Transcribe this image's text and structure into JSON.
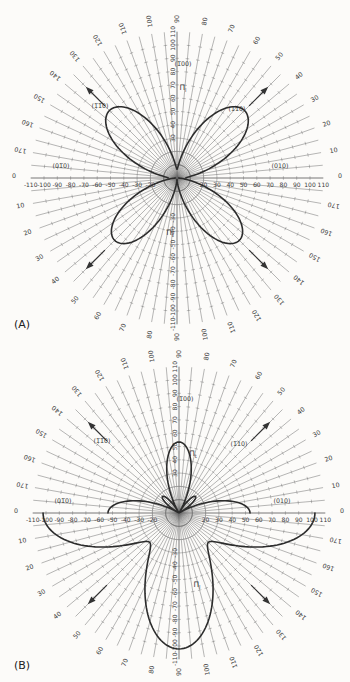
{
  "figure": {
    "background": "#fcfbf9",
    "colors": {
      "grid": "#6f6f6f",
      "axis": "#565656",
      "curve": "#2c2c2c",
      "text": "#3a3a3a",
      "arrow": "#333333"
    },
    "panels": [
      {
        "id": "A",
        "corner_label": "(A)",
        "crystal_labels": {
          "top": "(1̅00)",
          "right": "(010)",
          "left": "(01̅0)",
          "upper_right": "(1̅10)",
          "upper_left": "(1̅1̅0)"
        },
        "pi_labels": [
          {
            "base": "Π",
            "sub": "l",
            "position": "upper"
          },
          {
            "base": "Π",
            "sub": "t",
            "position": "lower"
          }
        ]
      },
      {
        "id": "B",
        "corner_label": "(B)",
        "crystal_labels": {
          "top": "(1̅00)",
          "right": "(010)",
          "left": "(01̅0)",
          "upper_right": "(1̅10)",
          "upper_left": "(1̅1̅0)"
        },
        "pi_labels": [
          {
            "base": "Π",
            "sub": "t",
            "position": "upper"
          },
          {
            "base": "Π",
            "sub": "l",
            "position": "lower"
          }
        ]
      }
    ],
    "protractor": {
      "angle_labels": [
        0,
        10,
        20,
        30,
        40,
        50,
        60,
        70,
        80,
        90,
        100,
        110,
        120,
        130,
        140,
        150,
        160,
        170
      ],
      "spoke_step_deg": 5,
      "radial_tick_step": 10,
      "radial_max": 110
    },
    "axes": {
      "horizontal_values": [
        -110,
        -100,
        -90,
        -80,
        -70,
        -60,
        -50,
        -40,
        -30,
        -20,
        20,
        30,
        40,
        50,
        60,
        70,
        80,
        90,
        100,
        110
      ],
      "vertical_values": [
        110,
        100,
        90,
        80,
        70,
        60,
        50,
        40,
        30,
        -30,
        -40,
        -50,
        -60,
        -70,
        -80,
        -90,
        -100,
        -110
      ]
    }
  },
  "chart_data": [
    {
      "type": "polar-rose",
      "panel": "A",
      "description": "Four-lobed rosette with lobes along the diagonal <110> directions",
      "angle_unit": "deg",
      "radial_range": [
        0,
        110
      ],
      "series": [
        {
          "name": "Pi_l (upper half)",
          "theta_deg_range": [
            0,
            180
          ],
          "r_formula": "abs(a + b*sin(2*theta)^2)",
          "a": 6.6,
          "b": 65.2,
          "key_points": [
            {
              "theta": 0,
              "r": 6.6
            },
            {
              "theta": 45,
              "r": 71.8
            },
            {
              "theta": 90,
              "r": 6.6
            },
            {
              "theta": 135,
              "r": 71.8
            },
            {
              "theta": 180,
              "r": 6.6
            }
          ]
        },
        {
          "name": "Pi_t (lower half)",
          "theta_deg_range": [
            180,
            360
          ],
          "r_formula": "abs(a + b*sin(2*theta)^2)",
          "a": 1.1,
          "b": 65.2,
          "key_points": [
            {
              "theta": 180,
              "r": 1.1
            },
            {
              "theta": 225,
              "r": 66.3
            },
            {
              "theta": 270,
              "r": 1.1
            },
            {
              "theta": 315,
              "r": 66.3
            },
            {
              "theta": 360,
              "r": 1.1
            }
          ]
        }
      ],
      "direction_arrows_deg": [
        45,
        135,
        225,
        315
      ]
    },
    {
      "type": "polar-rose",
      "panel": "B",
      "description": "Lobes along the <100> axes: small upper lobe and flat side lobes (upper half), large lower lobe and wide wings (lower half)",
      "angle_unit": "deg",
      "radial_range": [
        0,
        110
      ],
      "series": [
        {
          "name": "Pi_t (upper half)",
          "theta_deg_range": [
            0,
            180
          ],
          "r_formula": "abs(a + b*sin(2*theta)^2)",
          "a": 53.4,
          "b": -71,
          "key_points": [
            {
              "theta": 0,
              "r": 53.4
            },
            {
              "theta": 30,
              "r": 0
            },
            {
              "theta": 45,
              "r": 17.6
            },
            {
              "theta": 60,
              "r": 0
            },
            {
              "theta": 90,
              "r": 53.4
            },
            {
              "theta": 180,
              "r": 53.4
            }
          ]
        },
        {
          "name": "Pi_l (lower half)",
          "theta_deg_range": [
            180,
            360
          ],
          "r_formula": "abs(a + b*sin(2*theta)^2)",
          "a": 102.2,
          "b": -71,
          "key_points": [
            {
              "theta": 180,
              "r": 102.2
            },
            {
              "theta": 225,
              "r": 31.2
            },
            {
              "theta": 270,
              "r": 102.2
            },
            {
              "theta": 315,
              "r": 31.2
            },
            {
              "theta": 360,
              "r": 102.2
            }
          ]
        }
      ],
      "direction_arrows_deg": [
        45,
        135,
        225,
        315
      ]
    }
  ]
}
